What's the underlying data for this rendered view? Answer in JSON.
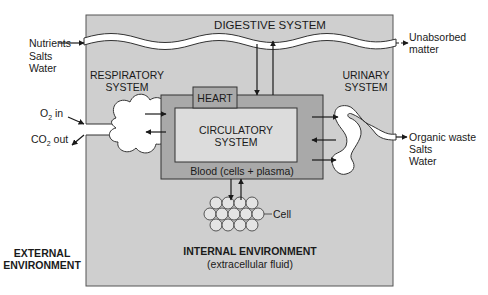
{
  "diagram": {
    "colors": {
      "internal_environment": "#cfcfcf",
      "circulatory_outer": "#a9a9a9",
      "circulatory_inner": "#dcdcdc",
      "heart": "#a9a9a9",
      "organ_lumen": "#ffffff",
      "cell": "#e4e4e4",
      "stroke": "#333333"
    },
    "labels": {
      "digestive_system": "DIGESTIVE SYSTEM",
      "nutrients": "Nutrients",
      "salts_in": "Salts",
      "water_in": "Water",
      "unabsorbed_1": "Unabsorbed",
      "unabsorbed_2": "matter",
      "respiratory_1": "RESPIRATORY",
      "respiratory_2": "SYSTEM",
      "o2_in_prefix": "O",
      "o2_in_sub": "2",
      "o2_in_suffix": " in",
      "co2_out_prefix": "CO",
      "co2_out_sub": "2",
      "co2_out_suffix": " out",
      "heart": "HEART",
      "circulatory_1": "CIRCULATORY",
      "circulatory_2": "SYSTEM",
      "blood": "Blood (cells + plasma)",
      "urinary_1": "URINARY",
      "urinary_2": "SYSTEM",
      "organic_waste": "Organic waste",
      "salts_out": "Salts",
      "water_out": "Water",
      "cell": "Cell",
      "external_1": "EXTERNAL",
      "external_2": "ENVIRONMENT",
      "internal_1": "INTERNAL ENVIRONMENT",
      "internal_2": "(extracellular fluid)"
    }
  }
}
